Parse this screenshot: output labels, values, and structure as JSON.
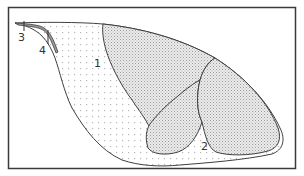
{
  "figure": {
    "type": "schematic line drawing",
    "background": "#ffffff",
    "frame_color": "#3a3a3a",
    "line_color": "#404040",
    "stipple_color": "#b8b8b8",
    "hatch_color": "#9a9a9a",
    "labels": [
      {
        "id": "1",
        "text": "1",
        "x": 94,
        "y": 67
      },
      {
        "id": "2",
        "text": "2",
        "x": 201,
        "y": 150
      },
      {
        "id": "3",
        "text": "3",
        "x": 18,
        "y": 41
      },
      {
        "id": "4",
        "text": "4",
        "x": 39,
        "y": 54
      }
    ],
    "regions": [
      {
        "name": "outer-body",
        "fill": "stippled dots",
        "label": "1"
      },
      {
        "name": "lower-pocket",
        "fill": "stippled dots",
        "label": "2"
      },
      {
        "name": "upper-hatched-lobe",
        "fill": "cross-hatch"
      },
      {
        "name": "lower-left-lobe",
        "fill": "cross-hatch"
      },
      {
        "name": "right-lobe",
        "fill": "cross-hatch"
      },
      {
        "name": "tip-band",
        "fill": "gray",
        "label": "4"
      },
      {
        "name": "tip-point",
        "fill": "none",
        "label": "3"
      }
    ]
  }
}
